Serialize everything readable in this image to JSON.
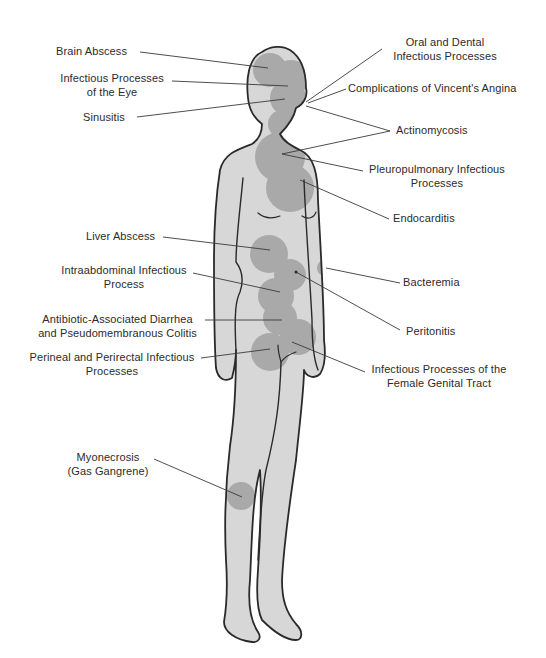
{
  "diagram": {
    "colors": {
      "background": "#ffffff",
      "body_fill": "#d7d7d7",
      "body_outline": "#2a2a2a",
      "infection_circle": "#a9a9a9",
      "leader_line": "#3a3a3a",
      "text": "#2b2b2b"
    },
    "labels_left": [
      {
        "id": "brain-abscess",
        "lines": [
          "Brain Abscess"
        ]
      },
      {
        "id": "eye",
        "lines": [
          "Infectious Processes",
          "of the Eye"
        ]
      },
      {
        "id": "sinusitis",
        "lines": [
          "Sinusitis"
        ]
      },
      {
        "id": "liver-abscess",
        "lines": [
          "Liver Abscess"
        ]
      },
      {
        "id": "intraabdominal",
        "lines": [
          "Intraabdominal Infectious",
          "Process"
        ]
      },
      {
        "id": "diarrhea",
        "lines": [
          "Antibiotic-Associated Diarrhea",
          "and Pseudomembranous Colitis"
        ]
      },
      {
        "id": "perineal",
        "lines": [
          "Perineal and Perirectal Infectious",
          "Processes"
        ]
      },
      {
        "id": "myonecrosis",
        "lines": [
          "Myonecrosis",
          "(Gas Gangrene)"
        ]
      }
    ],
    "labels_right": [
      {
        "id": "oral-dental",
        "lines": [
          "Oral and Dental",
          "Infectious Processes"
        ]
      },
      {
        "id": "vincent",
        "lines": [
          "Complications of Vincent's Angina"
        ]
      },
      {
        "id": "actinomycosis",
        "lines": [
          "Actinomycosis"
        ]
      },
      {
        "id": "pleuropulmonary",
        "lines": [
          "Pleuropulmonary Infectious",
          "Processes"
        ]
      },
      {
        "id": "endocarditis",
        "lines": [
          "Endocarditis"
        ]
      },
      {
        "id": "bacteremia",
        "lines": [
          "Bacteremia"
        ]
      },
      {
        "id": "peritonitis",
        "lines": [
          "Peritonitis"
        ]
      },
      {
        "id": "female-genital",
        "lines": [
          "Infectious Processes of the",
          "Female Genital Tract"
        ]
      }
    ]
  }
}
